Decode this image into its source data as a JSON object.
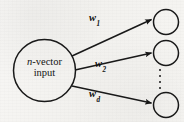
{
  "figure": {
    "background_color": "#f4f3f1",
    "stroke_color": "#1a1a1a"
  },
  "input_node": {
    "label_line_1_italic": "n",
    "label_line_1_rest": "-vector",
    "label_line_2": "input",
    "shape": "circle",
    "cx": 44.5,
    "cy": 70.5,
    "r": 31
  },
  "output_nodes": [
    {
      "name": "output-node-1",
      "cx": 166,
      "cy": 22,
      "r": 12.5
    },
    {
      "name": "output-node-2",
      "cx": 166,
      "cy": 53,
      "r": 12.5
    },
    {
      "name": "output-node-3",
      "cx": 166,
      "cy": 105,
      "r": 12.5
    }
  ],
  "edges": [
    {
      "name": "edge-w1",
      "weight_base": "w",
      "weight_sub": "1",
      "from": [
        72,
        56
      ],
      "to": [
        152,
        19
      ]
    },
    {
      "name": "edge-w2",
      "weight_base": "w",
      "weight_sub": "2",
      "from": [
        75,
        70
      ],
      "to": [
        152,
        53
      ]
    },
    {
      "name": "edge-wd",
      "weight_base": "w",
      "weight_sub": "d",
      "from": [
        72,
        86
      ],
      "to": [
        152,
        103
      ]
    }
  ],
  "ellipsis": {
    "name": "vertical-ellipsis",
    "dot_count": 4,
    "glyph": "⋮"
  }
}
